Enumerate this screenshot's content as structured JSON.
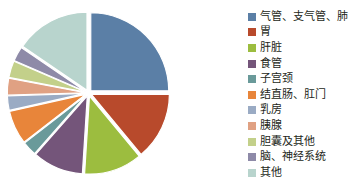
{
  "chart_data": {
    "type": "pie",
    "title": "",
    "subtitle": "",
    "xlabel": "",
    "ylabel": "",
    "legend_position": "right",
    "grid": false,
    "exploded": true,
    "start_angle_deg": 0,
    "direction": "clockwise",
    "categories": [
      "气管、支气管、肺",
      "胃",
      "肝脏",
      "食管",
      "子宫颈",
      "结直肠、肛门",
      "乳房",
      "胰腺",
      "胆囊及其他",
      "脑、神经系统",
      "其他"
    ],
    "values": [
      25.0,
      14.0,
      12.0,
      10.5,
      3.0,
      7.0,
      3.0,
      3.5,
      3.5,
      3.0,
      15.5
    ],
    "colors": [
      "#5b7fa6",
      "#b84a2c",
      "#9cbd3f",
      "#74557a",
      "#6a9a9a",
      "#e8853a",
      "#9aabc4",
      "#e0a183",
      "#c3d08a",
      "#8e8aa8",
      "#b8d4cd"
    ],
    "slices": [
      {
        "label": "气管、支气管、肺",
        "value": 25.0,
        "color": "#5b7fa6"
      },
      {
        "label": "胃",
        "value": 14.0,
        "color": "#b84a2c"
      },
      {
        "label": "肝脏",
        "value": 12.0,
        "color": "#9cbd3f"
      },
      {
        "label": "食管",
        "value": 10.5,
        "color": "#74557a"
      },
      {
        "label": "子宫颈",
        "value": 3.0,
        "color": "#6a9a9a"
      },
      {
        "label": "结直肠、肛门",
        "value": 7.0,
        "color": "#e8853a"
      },
      {
        "label": "乳房",
        "value": 3.0,
        "color": "#9aabc4"
      },
      {
        "label": "胰腺",
        "value": 3.5,
        "color": "#e0a183"
      },
      {
        "label": "胆囊及其他",
        "value": 3.5,
        "color": "#c3d08a"
      },
      {
        "label": "脑、神经系统",
        "value": 3.0,
        "color": "#8e8aa8"
      },
      {
        "label": "其他",
        "value": 15.5,
        "color": "#b8d4cd"
      }
    ]
  },
  "legend": {
    "items": [
      {
        "label": "气管、支气管、肺",
        "color": "#5b7fa6"
      },
      {
        "label": "胃",
        "color": "#b84a2c"
      },
      {
        "label": "肝脏",
        "color": "#9cbd3f"
      },
      {
        "label": "食管",
        "color": "#74557a"
      },
      {
        "label": "子宫颈",
        "color": "#6a9a9a"
      },
      {
        "label": "结直肠、肛门",
        "color": "#e8853a"
      },
      {
        "label": "乳房",
        "color": "#9aabc4"
      },
      {
        "label": "胰腺",
        "color": "#e0a183"
      },
      {
        "label": "胆囊及其他",
        "color": "#c3d08a"
      },
      {
        "label": "脑、神经系统",
        "color": "#8e8aa8"
      },
      {
        "label": "其他",
        "color": "#b8d4cd"
      }
    ]
  }
}
